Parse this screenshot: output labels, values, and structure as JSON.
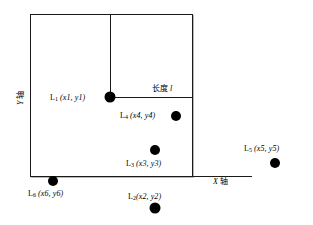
{
  "figure": {
    "type": "diagram",
    "axes": {
      "x_axis_label": "X 轴",
      "y_axis_label": "Y 轴"
    },
    "annotations": [
      {
        "name": "length-annotation",
        "text": "长度 l"
      }
    ],
    "points": [
      {
        "id": "L1",
        "label": "L₁ (x1, y1)",
        "base": "L",
        "sub": "1",
        "coords": "(x1, y1)",
        "cx": 110,
        "cy": 97,
        "r": 5.5
      },
      {
        "id": "L4",
        "label": "L₄ (x4, y4)",
        "base": "L",
        "sub": "4",
        "coords": "(x4, y4)",
        "cx": 176,
        "cy": 116,
        "r": 5.0
      },
      {
        "id": "L3",
        "label": "L₃ (x3, y3)",
        "base": "L",
        "sub": "3",
        "coords": "(x3, y3)",
        "cx": 155,
        "cy": 150,
        "r": 5.0
      },
      {
        "id": "L5",
        "label": "L₅ (x5, y5)",
        "base": "L",
        "sub": "5",
        "coords": "(x5, y5)",
        "cx": 275,
        "cy": 163,
        "r": 5.0
      },
      {
        "id": "L6",
        "label": "L₆ (x6, y6)",
        "base": "L",
        "sub": "6",
        "coords": "(x6, y6)",
        "cx": 53,
        "cy": 181,
        "r": 5.0
      },
      {
        "id": "L2",
        "label": "L₂(x2, y2)",
        "base": "L",
        "sub": "2",
        "coords": "(x2, y2)",
        "cx": 155,
        "cy": 208,
        "r": 5.5
      }
    ],
    "labels": {
      "L1_base": "L",
      "L1_sub": "1",
      "L1_coords": "(x1, y1)",
      "L2_base": "L",
      "L2_sub": "2",
      "L2_coords": "(x2, y2)",
      "L3_base": "L",
      "L3_sub": "3",
      "L3_coords": "(x3, y3)",
      "L4_base": "L",
      "L4_sub": "4",
      "L4_coords": "(x4, y4)",
      "L5_base": "L",
      "L5_sub": "5",
      "L5_coords": "(x5, y5)",
      "L6_base": "L",
      "L6_sub": "6",
      "L6_coords": "(x6, y6)",
      "length_text": "长度",
      "length_symbol": "l",
      "x_axis_letter": "X",
      "x_axis_word": "轴",
      "y_axis_letter": "Y",
      "y_axis_word": "轴"
    }
  }
}
